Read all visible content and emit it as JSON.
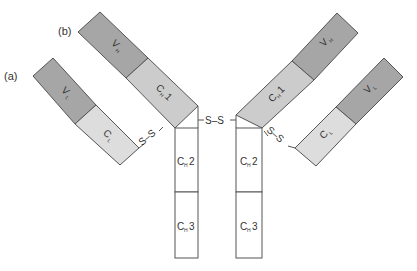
{
  "diagram": {
    "labels": {
      "a": "(a)",
      "b": "(b)"
    },
    "domains": {
      "vh": {
        "main": "V",
        "sub": "H"
      },
      "vl": {
        "main": "V",
        "sub": "L"
      },
      "ch1": {
        "main": "C",
        "sub": "H",
        "num": "1"
      },
      "ch2": {
        "main": "C",
        "sub": "H",
        "num": "2"
      },
      "ch3": {
        "main": "C",
        "sub": "H",
        "num": "3"
      },
      "cl": {
        "main": "C",
        "sub": "L"
      }
    },
    "disulfide": "S–S",
    "colors": {
      "variable": "#a6a6a6",
      "constant_light": "#d9d9d9",
      "ch1": "#cccccc",
      "fc": "#ffffff",
      "stroke": "#555555"
    }
  }
}
